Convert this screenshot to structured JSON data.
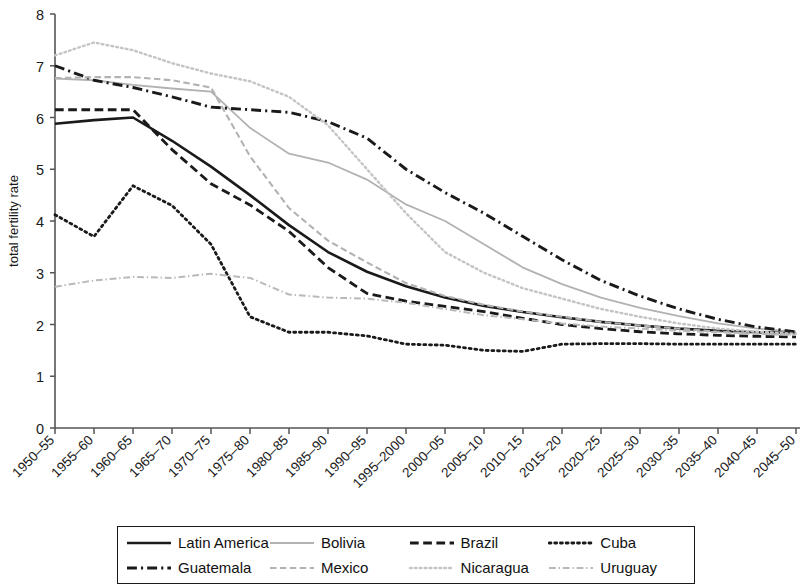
{
  "chart_data": {
    "type": "line",
    "title": "",
    "xlabel": "",
    "ylabel": "total fertility rate",
    "ylim": [
      0,
      8
    ],
    "yticks": [
      0,
      1,
      2,
      3,
      4,
      5,
      6,
      7,
      8
    ],
    "grid": false,
    "legend_position": "bottom",
    "categories": [
      "1950–55",
      "1955–60",
      "1960–65",
      "1965–70",
      "1970–75",
      "1975–80",
      "1980–85",
      "1985–90",
      "1990–95",
      "1995–2000",
      "2000–05",
      "2005–10",
      "2010–15",
      "2015–20",
      "2020–25",
      "2025–30",
      "2030–35",
      "2035–40",
      "2040–45",
      "2045–50"
    ],
    "series": [
      {
        "name": "Latin America",
        "style": "solid",
        "color": "#1a1a1a",
        "width": 2.6,
        "values": [
          5.88,
          5.95,
          6.0,
          5.55,
          5.05,
          4.5,
          3.92,
          3.4,
          3.02,
          2.74,
          2.52,
          2.36,
          2.24,
          2.14,
          2.05,
          1.98,
          1.92,
          1.88,
          1.85,
          1.84
        ]
      },
      {
        "name": "Bolivia",
        "style": "solid",
        "color": "#b2b2b2",
        "width": 1.8,
        "values": [
          6.75,
          6.72,
          6.63,
          6.56,
          6.5,
          5.8,
          5.3,
          5.13,
          4.8,
          4.32,
          4.0,
          3.55,
          3.1,
          2.78,
          2.52,
          2.32,
          2.16,
          2.02,
          1.92,
          1.86
        ]
      },
      {
        "name": "Brazil",
        "style": "dashed",
        "color": "#1a1a1a",
        "width": 2.8,
        "values": [
          6.15,
          6.15,
          6.15,
          5.38,
          4.72,
          4.31,
          3.8,
          3.1,
          2.6,
          2.45,
          2.35,
          2.25,
          2.12,
          2.0,
          1.92,
          1.86,
          1.82,
          1.79,
          1.77,
          1.76
        ]
      },
      {
        "name": "Cuba",
        "style": "dotted",
        "color": "#1a1a1a",
        "width": 2.8,
        "values": [
          4.12,
          3.7,
          4.68,
          4.3,
          3.55,
          2.15,
          1.85,
          1.85,
          1.78,
          1.62,
          1.6,
          1.5,
          1.48,
          1.62,
          1.63,
          1.63,
          1.62,
          1.62,
          1.62,
          1.62
        ]
      },
      {
        "name": "Guatemala",
        "style": "dashdot",
        "color": "#1a1a1a",
        "width": 2.9,
        "values": [
          7.0,
          6.72,
          6.58,
          6.4,
          6.2,
          6.15,
          6.1,
          5.92,
          5.6,
          5.0,
          4.55,
          4.15,
          3.7,
          3.25,
          2.85,
          2.55,
          2.3,
          2.1,
          1.95,
          1.86
        ]
      },
      {
        "name": "Mexico",
        "style": "dashed",
        "color": "#b2b2b2",
        "width": 2.1,
        "values": [
          6.76,
          6.78,
          6.78,
          6.72,
          6.58,
          5.25,
          4.25,
          3.62,
          3.2,
          2.8,
          2.55,
          2.38,
          2.25,
          2.15,
          2.05,
          1.98,
          1.92,
          1.86,
          1.82,
          1.8
        ]
      },
      {
        "name": "Nicaragua",
        "style": "dotted",
        "color": "#c4c4c4",
        "width": 2.4,
        "values": [
          7.2,
          7.45,
          7.3,
          7.05,
          6.85,
          6.7,
          6.4,
          5.85,
          5.0,
          4.15,
          3.4,
          3.0,
          2.7,
          2.5,
          2.3,
          2.15,
          2.02,
          1.92,
          1.86,
          1.82
        ]
      },
      {
        "name": "Uruguay",
        "style": "dashdot",
        "color": "#b9b9b9",
        "width": 2.0,
        "values": [
          2.73,
          2.85,
          2.92,
          2.9,
          2.98,
          2.9,
          2.58,
          2.52,
          2.5,
          2.42,
          2.3,
          2.18,
          2.1,
          2.02,
          1.96,
          1.92,
          1.88,
          1.85,
          1.82,
          1.8
        ]
      }
    ]
  },
  "legend": {
    "items": [
      {
        "label": "Latin America",
        "series": 0
      },
      {
        "label": "Bolivia",
        "series": 1
      },
      {
        "label": "Brazil",
        "series": 2
      },
      {
        "label": "Cuba",
        "series": 3
      },
      {
        "label": "Guatemala",
        "series": 4
      },
      {
        "label": "Mexico",
        "series": 5
      },
      {
        "label": "Nicaragua",
        "series": 6
      },
      {
        "label": "Uruguay",
        "series": 7
      }
    ]
  }
}
